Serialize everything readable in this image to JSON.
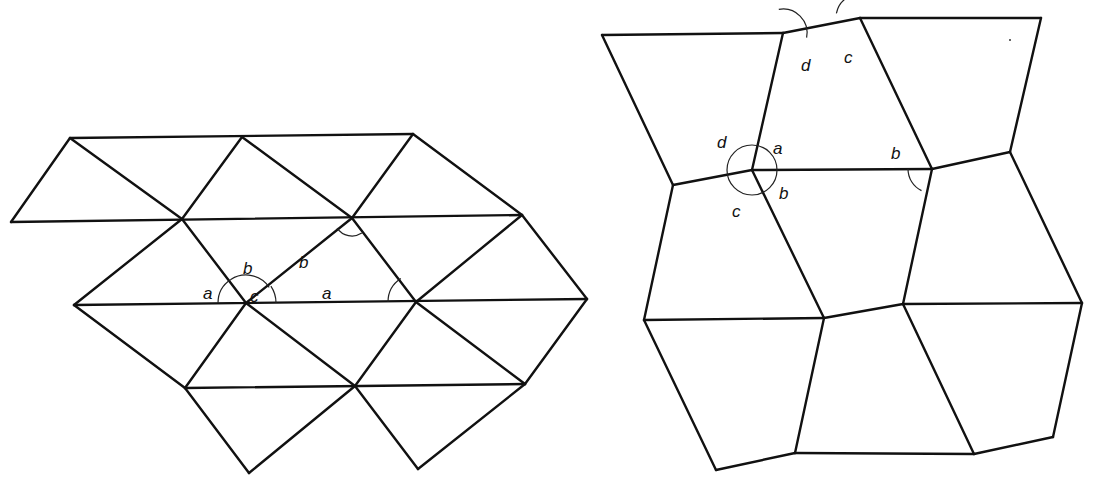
{
  "figure": {
    "left_panel": {
      "name": "triangle-tessellation",
      "vertices": {
        "A": [
          70,
          138
        ],
        "B": [
          242,
          137
        ],
        "C": [
          413,
          134
        ],
        "D": [
          11,
          222
        ],
        "E": [
          182,
          219
        ],
        "F": [
          352,
          218
        ],
        "G": [
          522,
          215
        ],
        "H": [
          74,
          305
        ],
        "I": [
          246,
          303
        ],
        "J": [
          416,
          302
        ],
        "K": [
          587,
          299
        ],
        "L": [
          185,
          388
        ],
        "M": [
          355,
          386
        ],
        "N": [
          525,
          384
        ],
        "O": [
          249,
          473
        ],
        "P": [
          418,
          469
        ]
      },
      "edges": [
        [
          "A",
          "C"
        ],
        [
          "D",
          "G"
        ],
        [
          "H",
          "K"
        ],
        [
          "L",
          "N"
        ],
        [
          "D",
          "A"
        ],
        [
          "A",
          "E"
        ],
        [
          "E",
          "B"
        ],
        [
          "B",
          "F"
        ],
        [
          "F",
          "C"
        ],
        [
          "C",
          "G"
        ],
        [
          "H",
          "E"
        ],
        [
          "E",
          "I"
        ],
        [
          "I",
          "F"
        ],
        [
          "F",
          "J"
        ],
        [
          "J",
          "G"
        ],
        [
          "G",
          "K"
        ],
        [
          "H",
          "L"
        ],
        [
          "L",
          "I"
        ],
        [
          "I",
          "M"
        ],
        [
          "M",
          "J"
        ],
        [
          "J",
          "N"
        ],
        [
          "N",
          "K"
        ],
        [
          "L",
          "O"
        ],
        [
          "O",
          "M"
        ],
        [
          "M",
          "P"
        ],
        [
          "P",
          "N"
        ]
      ],
      "angle_marks": [
        {
          "label": "a",
          "vertex": "I",
          "r": 28,
          "from_deg": 180,
          "to_deg": 123,
          "label_pos": [
            203,
            293
          ]
        },
        {
          "label": "b",
          "vertex": "I",
          "r": 28,
          "from_deg": 123,
          "to_deg": 34,
          "label_pos": [
            243,
            268
          ]
        },
        {
          "label": "c",
          "vertex": "I",
          "r": 30,
          "from_deg": 34,
          "to_deg": 0,
          "label_pos": [
            250,
            296
          ]
        },
        {
          "label": "b",
          "vertex": "F",
          "r": 18,
          "from_deg": 214,
          "to_deg": 303,
          "label_pos": [
            299,
            262
          ]
        },
        {
          "label": "a",
          "vertex": "J",
          "r": 28,
          "from_deg": 180,
          "to_deg": 123,
          "label_pos": [
            322,
            293
          ]
        }
      ]
    },
    "right_panel": {
      "name": "quadrilateral-tessellation",
      "vertices": {
        "A": [
          602,
          35
        ],
        "B": [
          783,
          33
        ],
        "C": [
          860,
          18
        ],
        "D": [
          1041,
          18
        ],
        "E": [
          673,
          185
        ],
        "F": [
          752,
          170
        ],
        "G": [
          932,
          169
        ],
        "H": [
          1010,
          152
        ],
        "I": [
          644,
          320
        ],
        "J": [
          824,
          318
        ],
        "K": [
          903,
          304
        ],
        "L": [
          1082,
          303
        ],
        "M": [
          716,
          470
        ],
        "N": [
          795,
          453
        ],
        "O": [
          974,
          454
        ],
        "P": [
          1053,
          437
        ]
      },
      "edges": [
        [
          "A",
          "B"
        ],
        [
          "B",
          "C"
        ],
        [
          "C",
          "D"
        ],
        [
          "A",
          "E"
        ],
        [
          "B",
          "F"
        ],
        [
          "C",
          "G"
        ],
        [
          "D",
          "H"
        ],
        [
          "E",
          "F"
        ],
        [
          "F",
          "G"
        ],
        [
          "G",
          "H"
        ],
        [
          "E",
          "I"
        ],
        [
          "F",
          "J"
        ],
        [
          "G",
          "K"
        ],
        [
          "H",
          "L"
        ],
        [
          "I",
          "J"
        ],
        [
          "J",
          "K"
        ],
        [
          "K",
          "L"
        ],
        [
          "I",
          "M"
        ],
        [
          "J",
          "N"
        ],
        [
          "K",
          "O"
        ],
        [
          "L",
          "P"
        ],
        [
          "M",
          "N"
        ],
        [
          "N",
          "O"
        ],
        [
          "O",
          "P"
        ]
      ],
      "angle_marks": [
        {
          "label": "d",
          "vertex": "F",
          "r": 25,
          "full_circle": true,
          "label_pos": [
            717,
            142
          ]
        },
        {
          "label": "a",
          "vertex": "F",
          "label_pos": [
            773,
            148
          ]
        },
        {
          "label": "b",
          "vertex": "F",
          "label_pos": [
            779,
            193
          ]
        },
        {
          "label": "c",
          "vertex": "F",
          "label_pos": [
            732,
            211
          ]
        },
        {
          "label": "d",
          "vertex": "B",
          "r": 24,
          "from_deg": -11,
          "to_deg": 100,
          "label_pos": [
            801,
            65
          ]
        },
        {
          "label": "c",
          "vertex": "C",
          "r": 24,
          "from_deg": 64,
          "to_deg": 169,
          "label_pos": [
            844,
            57
          ]
        },
        {
          "label": "b",
          "vertex": "G",
          "r": 24,
          "from_deg": 180,
          "to_deg": 244,
          "label_pos": [
            891,
            153
          ]
        }
      ],
      "stray_dot": [
        1010,
        40
      ]
    }
  }
}
